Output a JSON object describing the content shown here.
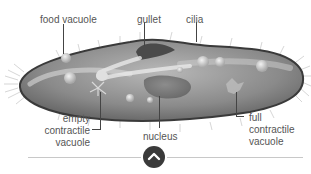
{
  "diagram": {
    "labels": {
      "food_vacuole": "food vacuole",
      "gullet": "gullet",
      "cilia": "cilia",
      "empty_contractile_vacuole": [
        "empty",
        "contractile",
        "vacuole"
      ],
      "nucleus": "nucleus",
      "full_contractile_vacuole": [
        "full",
        "contractile",
        "vacuole"
      ]
    }
  },
  "controls": {
    "scroll_up_icon": "chevron-up-icon"
  },
  "colors": {
    "body_fill": "#8f8f8f",
    "outline": "#3a3a3a",
    "label_text": "#555555",
    "button_bg": "#3a3a3a"
  }
}
